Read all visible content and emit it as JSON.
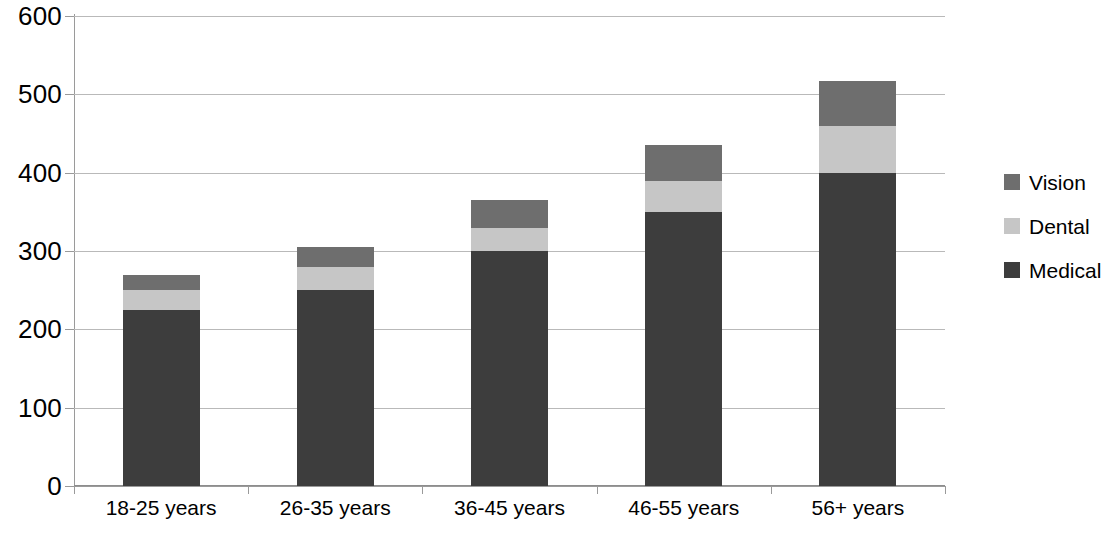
{
  "chart_data": {
    "type": "bar",
    "subtype": "stacked-column",
    "title": "",
    "xlabel": "",
    "ylabel": "",
    "categories": [
      "18-25 years",
      "26-35 years",
      "36-45 years",
      "46-55 years",
      "56+ years"
    ],
    "series": [
      {
        "name": "Medical",
        "color": "#3d3d3d",
        "values": [
          225,
          250,
          300,
          350,
          400
        ]
      },
      {
        "name": "Dental",
        "color": "#c6c6c6",
        "values": [
          25,
          30,
          30,
          40,
          60
        ]
      },
      {
        "name": "Vision",
        "color": "#6e6e6e",
        "values": [
          20,
          25,
          35,
          45,
          57
        ]
      }
    ],
    "stack_order_bottom_to_top": [
      "Medical",
      "Dental",
      "Vision"
    ],
    "totals": [
      270,
      305,
      365,
      435,
      517
    ],
    "ylim": [
      0,
      600
    ],
    "ytick_step": 100,
    "yticks": [
      "600",
      "500",
      "400",
      "300",
      "200",
      "100",
      "0"
    ],
    "ytick_values": [
      600,
      500,
      400,
      300,
      200,
      100,
      0
    ],
    "grid": true,
    "grid_axis": "y",
    "legend_position": "right",
    "legend_entries": [
      "Vision",
      "Dental",
      "Medical"
    ],
    "colors": {
      "medical": "#3d3d3d",
      "dental": "#c6c6c6",
      "vision": "#6e6e6e",
      "gridline": "#b9b9b9",
      "axis": "#9a9a9a",
      "text": "#000000",
      "background": "#ffffff"
    }
  }
}
